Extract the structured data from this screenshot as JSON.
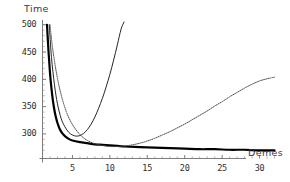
{
  "chart_data": {
    "type": "line",
    "title": "",
    "xlabel": "Demes",
    "ylabel": "Time",
    "xlim": [
      1,
      33
    ],
    "ylim": [
      255,
      505
    ],
    "grid": false,
    "legend": "none",
    "xticks": [
      5,
      10,
      15,
      20,
      25,
      30
    ],
    "yticks": [
      300,
      350,
      400,
      450,
      500
    ],
    "xtick_labels": [
      "5",
      "10",
      "15",
      "20",
      "25",
      "30"
    ],
    "ytick_labels": [
      "300",
      "350",
      "400",
      "450",
      "500"
    ],
    "series": [
      {
        "name": "thick-decay-curve",
        "style": "solid-thick",
        "color": "#000000",
        "x": [
          1.6,
          1.8,
          2.0,
          2.2,
          2.4,
          2.6,
          2.8,
          3.0,
          3.3,
          3.6,
          4.0,
          4.5,
          5.0,
          6.0,
          7.0,
          8.0,
          9.0,
          10.0,
          11.0,
          12.0,
          14.0,
          16.0,
          18.0,
          20.0,
          22.0,
          24.0,
          26.0,
          28.0,
          30.0,
          32.0
        ],
        "y": [
          500,
          452,
          412,
          383,
          360,
          343,
          330,
          320,
          309,
          302,
          296,
          291,
          288,
          285,
          283,
          281,
          280,
          279,
          278,
          277,
          276,
          275,
          274,
          273,
          272,
          272,
          271,
          271,
          270,
          270
        ]
      },
      {
        "name": "thin-u-curve",
        "style": "solid-thin",
        "color": "#1a1a1a",
        "x": [
          1.9,
          2.2,
          2.6,
          3.0,
          3.5,
          4.0,
          4.5,
          5.0,
          5.5,
          6.0,
          6.5,
          7.0,
          7.5,
          8.0,
          8.5,
          9.0,
          9.5,
          10.0,
          10.5,
          11.0,
          11.5,
          11.9
        ],
        "y": [
          500,
          440,
          390,
          355,
          328,
          313,
          303,
          298,
          296,
          297,
          301,
          308,
          318,
          331,
          347,
          365,
          386,
          409,
          435,
          463,
          492,
          505
        ]
      },
      {
        "name": "dotted-u-curve",
        "style": "dotted",
        "color": "#4a4a4a",
        "x": [
          2.0,
          2.3,
          2.7,
          3.1,
          3.6,
          4.2,
          4.8,
          5.5,
          6.2,
          7.0,
          8.0,
          9.0,
          10.0,
          11.0,
          12.0,
          13.0,
          14.0,
          15.0,
          16.0,
          17.0,
          18.0,
          19.0,
          20.0,
          21.0,
          22.0,
          23.0,
          24.0,
          25.0,
          26.0,
          27.0,
          28.0,
          29.0,
          30.0,
          31.0,
          32.0
        ],
        "y": [
          500,
          462,
          425,
          395,
          366,
          340,
          322,
          307,
          296,
          288,
          282,
          279,
          277,
          277,
          278,
          280,
          283,
          287,
          292,
          298,
          304,
          311,
          318,
          326,
          334,
          342,
          351,
          359,
          368,
          376,
          384,
          391,
          397,
          401,
          404
        ]
      }
    ]
  },
  "axes": {
    "y_title": "Time",
    "x_title": "Demes"
  }
}
